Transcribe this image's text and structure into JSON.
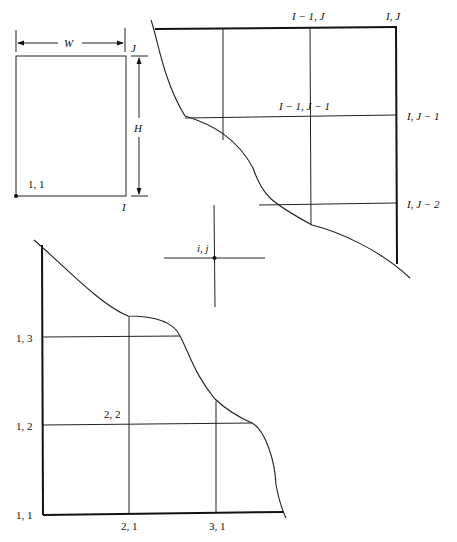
{
  "figure": {
    "rectangle": {
      "width_label": "W",
      "height_label": "H",
      "corner_origin_label": "1, 1",
      "top_right_label": "J",
      "bottom_right_label": "I"
    },
    "top_right_grid": {
      "labels": {
        "i_minus_1_j": "I − 1, J",
        "i_j": "I, J",
        "i_minus_1_j_minus_1": "I − 1, J − 1",
        "i_j_minus_1": "I, J − 1",
        "i_j_minus_2": "I, J − 2"
      }
    },
    "generic_node": {
      "label": "i, j"
    },
    "bottom_left_grid": {
      "labels": {
        "n_1_3": "1, 3",
        "n_1_2": "1, 2",
        "n_1_1": "1, 1",
        "n_2_2": "2, 2",
        "n_2_1": "2, 1",
        "n_3_1": "3, 1"
      }
    }
  }
}
